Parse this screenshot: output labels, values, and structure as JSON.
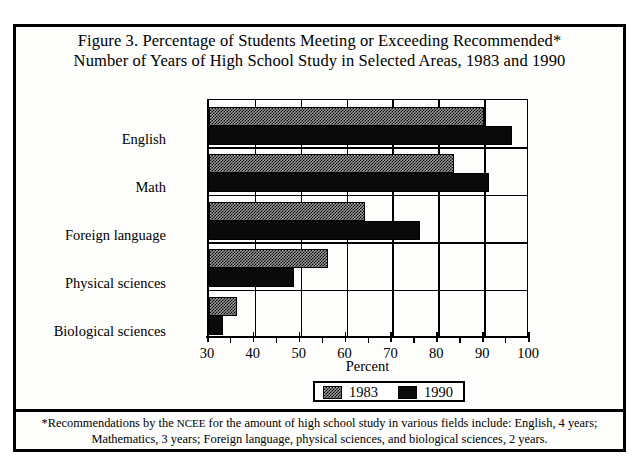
{
  "figure": {
    "title_line1": "Figure 3. Percentage of Students Meeting or Exceeding Recommended*",
    "title_line2": "Number of Years of High School Study in Selected Areas, 1983 and 1990",
    "footnote_line1_a": "*Recommendations by the ",
    "footnote_line1_b": "NCEE",
    "footnote_line1_c": " for the amount of high school study in various fields include: English, 4 years;",
    "footnote_line2": "Mathematics, 3 years; Foreign language, physical sciences, and biological sciences, 2 years."
  },
  "chart_data": {
    "type": "bar",
    "orientation": "horizontal",
    "title": "Figure 3. Percentage of Students Meeting or Exceeding Recommended* Number of Years of High School Study in Selected Areas, 1983 and 1990",
    "categories": [
      "English",
      "Math",
      "Foreign language",
      "Physical sciences",
      "Biological sciences"
    ],
    "series": [
      {
        "name": "1983",
        "color": "#9a9a9a",
        "pattern": "checker-dither",
        "values": [
          90,
          83.5,
          64,
          56,
          36
        ]
      },
      {
        "name": "1990",
        "color": "#0a0a0a",
        "pattern": "solid",
        "values": [
          96,
          91,
          76,
          48.5,
          33
        ]
      }
    ],
    "xlabel": "Percent",
    "ylabel": "",
    "xlim": [
      30,
      100
    ],
    "xticks": [
      30,
      40,
      50,
      60,
      70,
      80,
      90,
      100
    ],
    "xtick_labels": [
      "30",
      "40",
      "50",
      "60",
      "70",
      "80",
      "90",
      "100"
    ],
    "xminor_ticks": [
      35,
      45,
      55,
      65,
      75,
      85,
      95
    ],
    "grid": "vertical-major",
    "legend_position": "bottom-center",
    "legend_entries": [
      "1983",
      "1990"
    ]
  }
}
